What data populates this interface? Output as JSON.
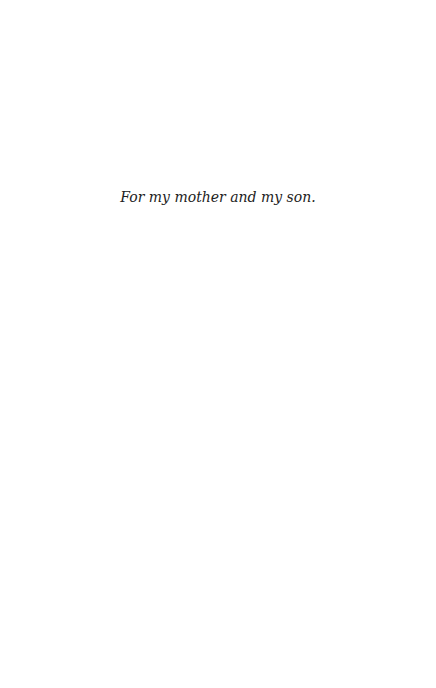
{
  "page": {
    "dedication": "For my mother and my son."
  }
}
